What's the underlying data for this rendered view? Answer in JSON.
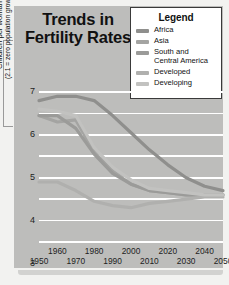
{
  "title": {
    "line1": "Trends in",
    "line2": "Fertility Rates"
  },
  "legend": {
    "heading": "Legend",
    "position": "top-right",
    "items": [
      {
        "label": "Africa",
        "color": "#8f8f8d"
      },
      {
        "label": "Asia",
        "color": "#a4a4a2"
      },
      {
        "label": "South and\nCentral America",
        "color": "#9b9b99"
      },
      {
        "label": "Developed",
        "color": "#b0b0ae"
      },
      {
        "label": "Developing",
        "color": "#c2c2c0"
      }
    ]
  },
  "axes": {
    "ylabel_line1": "Children per woman",
    "ylabel_line2": "(2.1 = zero population growth)",
    "yticks": [
      "0",
      "1",
      "2",
      "3",
      "4",
      "5",
      "6",
      "7"
    ],
    "xticks_top": [
      "1960",
      "1980",
      "2000",
      "2020",
      "2040"
    ],
    "xticks_bottom": [
      "1950",
      "1970",
      "1990",
      "2010",
      "2030",
      "2050"
    ]
  },
  "colors": {
    "panel_background": "#bdbdbb",
    "gridline": "#ffffff",
    "legend_background": "#ffffff",
    "legend_border": "#3a3a3a",
    "text": "#111111"
  },
  "chart_data": {
    "type": "line",
    "title": "Trends in Fertility Rates",
    "xlabel": "",
    "ylabel": "Children per woman (2.1 = zero population growth)",
    "xlim": [
      1950,
      2050
    ],
    "ylim": [
      0,
      7
    ],
    "grid": true,
    "legend_position": "top-right",
    "x": [
      1950,
      1960,
      1970,
      1980,
      1990,
      2000,
      2010,
      2020,
      2030,
      2040,
      2050
    ],
    "series": [
      {
        "name": "Africa",
        "color": "#8f8f8d",
        "values": [
          6.6,
          6.8,
          6.8,
          6.6,
          5.9,
          5.1,
          4.3,
          3.6,
          3.0,
          2.6,
          2.4
        ]
      },
      {
        "name": "Asia",
        "color": "#a4a4a2",
        "values": [
          5.9,
          5.6,
          5.7,
          4.2,
          3.3,
          2.7,
          2.4,
          2.3,
          2.2,
          2.2,
          2.2
        ]
      },
      {
        "name": "South and Central America",
        "color": "#9b9b99",
        "values": [
          5.9,
          5.9,
          5.3,
          4.1,
          3.2,
          2.7,
          2.4,
          2.3,
          2.2,
          2.2,
          2.2
        ]
      },
      {
        "name": "Developed",
        "color": "#b0b0ae",
        "values": [
          2.8,
          2.8,
          2.4,
          1.9,
          1.7,
          1.6,
          1.8,
          1.9,
          2.0,
          2.1,
          2.1
        ]
      },
      {
        "name": "Developing",
        "color": "#c2c2c0",
        "values": [
          6.2,
          6.1,
          5.9,
          4.4,
          3.5,
          2.9,
          2.5,
          2.4,
          2.3,
          2.2,
          2.2
        ]
      }
    ]
  }
}
